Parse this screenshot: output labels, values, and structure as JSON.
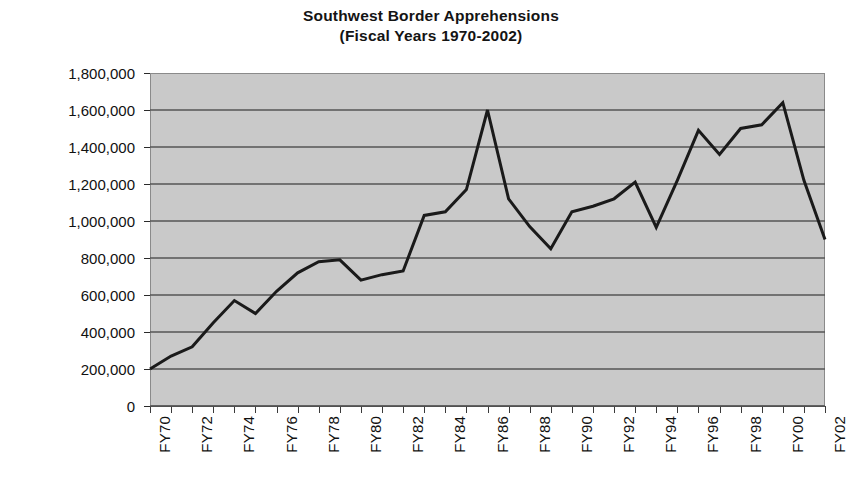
{
  "chart_data": {
    "type": "line",
    "title": "Southwest Border Apprehensions",
    "subtitle": "(Fiscal Years 1970-2002)",
    "title_lines": [
      "Southwest Border Apprehensions",
      "(Fiscal Years 1970-2002)"
    ],
    "xlabel": "",
    "ylabel": "",
    "ylim": [
      0,
      1800000
    ],
    "ytick_step": 200000,
    "grid": true,
    "legend": false,
    "legend_position": "none",
    "plot_background": "#c9c9c9",
    "line_color": "#1a1a1a",
    "gridline_color": "#555555",
    "ytick_labels": [
      "1,800,000",
      "1,600,000",
      "1,400,000",
      "1,200,000",
      "1,000,000",
      "800,000",
      "600,000",
      "400,000",
      "200,000",
      "0"
    ],
    "ytick_values": [
      1800000,
      1600000,
      1400000,
      1200000,
      1000000,
      800000,
      600000,
      400000,
      200000,
      0
    ],
    "xtick_labels": [
      "FY70",
      "FY72",
      "FY74",
      "FY76",
      "FY78",
      "FY80",
      "FY82",
      "FY84",
      "FY86",
      "FY88",
      "FY90",
      "FY92",
      "FY94",
      "FY96",
      "FY98",
      "FY00",
      "FY02"
    ],
    "categories": [
      "FY70",
      "FY71",
      "FY72",
      "FY73",
      "FY74",
      "FY75",
      "FY76",
      "FY77",
      "FY78",
      "FY79",
      "FY80",
      "FY81",
      "FY82",
      "FY83",
      "FY84",
      "FY85",
      "FY86",
      "FY87",
      "FY88",
      "FY89",
      "FY90",
      "FY91",
      "FY92",
      "FY93",
      "FY94",
      "FY95",
      "FY96",
      "FY97",
      "FY98",
      "FY99",
      "FY00",
      "FY01",
      "FY02"
    ],
    "values": [
      200000,
      270000,
      320000,
      450000,
      570000,
      500000,
      620000,
      720000,
      780000,
      790000,
      680000,
      710000,
      730000,
      1030000,
      1050000,
      1170000,
      1600000,
      1120000,
      970000,
      850000,
      1050000,
      1080000,
      1120000,
      1210000,
      965000,
      1220000,
      1490000,
      1360000,
      1500000,
      1520000,
      1640000,
      1220000,
      900000
    ],
    "series": [
      {
        "name": "Southwest Border Apprehensions",
        "values": [
          200000,
          270000,
          320000,
          450000,
          570000,
          500000,
          620000,
          720000,
          780000,
          790000,
          680000,
          710000,
          730000,
          1030000,
          1050000,
          1170000,
          1600000,
          1120000,
          970000,
          850000,
          1050000,
          1080000,
          1120000,
          1210000,
          965000,
          1220000,
          1490000,
          1360000,
          1500000,
          1520000,
          1640000,
          1220000,
          900000
        ]
      }
    ]
  }
}
